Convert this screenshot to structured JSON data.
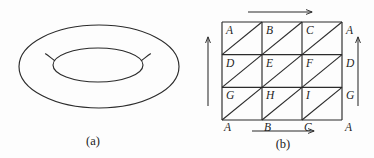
{
  "figure": {
    "background_color": "#fdfdfd",
    "stroke_color": "#2b2b2b",
    "label_color": "#1f1f1f",
    "panels": [
      {
        "id": "panel-a",
        "caption": "(a)",
        "kind": "torus-drawing",
        "description": "Outline drawing of a torus (donut) seen in oblique view"
      },
      {
        "id": "panel-b",
        "caption": "(b)",
        "kind": "fundamental-square-triangulation",
        "description": "Square with identified edges, subdivided into a 3 by 3 grid of cells, each cell cut by a diagonal from its lower-left to its upper-right corner"
      }
    ]
  },
  "panel_a": {
    "caption": "(a)",
    "outer_ellipse": {
      "cx": 99,
      "cy": 66.5,
      "rx": 80,
      "ry": 41.5
    },
    "inner_ellipse": {
      "cx": 98,
      "cy": 65,
      "rx": 45,
      "ry": 17
    },
    "left_tip_arc": "M 53.5 59 C 49.5 56.5, 47.5 55.0, 46.0 54.0",
    "right_tip_arc": "M 142.5 59 C 146.5 56.5, 148.5 55.0, 150.5 54.0"
  },
  "panel_b": {
    "caption": "(b)",
    "grid": {
      "x0": 222,
      "y0": 22,
      "x1": 342,
      "y1": 120,
      "columns": 3,
      "rows": 3,
      "cell_width": 40,
      "cell_height": 32.6667,
      "diagonal_direction": "lower-left-to-upper-right"
    },
    "interior_labels": [
      [
        "A",
        "B",
        "C"
      ],
      [
        "D",
        "E",
        "F"
      ],
      [
        "G",
        "H",
        "I"
      ]
    ],
    "right_edge_labels": [
      "A",
      "D",
      "G"
    ],
    "bottom_edge_labels": [
      "A",
      "B",
      "C"
    ],
    "bottom_right_corner_label": "A",
    "arrows": [
      {
        "name": "top-edge-arrow",
        "direction": "right",
        "x1": 248,
        "y1": 12,
        "x2": 312,
        "y2": 12
      },
      {
        "name": "bottom-edge-arrow",
        "direction": "right",
        "x1": 252,
        "y1": 131,
        "x2": 314,
        "y2": 131
      },
      {
        "name": "left-edge-arrow",
        "direction": "up",
        "x1": 208,
        "y1": 106,
        "x2": 208,
        "y2": 37
      },
      {
        "name": "right-edge-arrow",
        "direction": "up",
        "x1": 358,
        "y1": 106,
        "x2": 358,
        "y2": 37
      }
    ]
  }
}
